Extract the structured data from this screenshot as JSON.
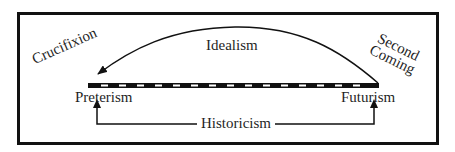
{
  "diagram": {
    "type": "eschatology-interpretations",
    "colors": {
      "line": "#111111",
      "text": "#1f1f1f",
      "background": "#ffffff"
    },
    "timeline": {
      "left_label": "Preterism",
      "right_label": "Futurism",
      "style": "dashed-black-white-bar"
    },
    "arc": {
      "label": "Idealism",
      "direction": "right-to-left",
      "start_event": {
        "line1": "Second",
        "line2": "Coming"
      },
      "end_event": "Crucifixion"
    },
    "bottom_connector": {
      "label": "Historicism",
      "arrows": [
        "up-to-preterism",
        "up-to-futurism"
      ]
    }
  }
}
